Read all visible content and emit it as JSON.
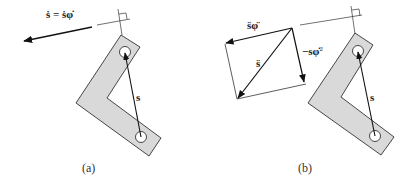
{
  "figure": {
    "panels": [
      {
        "id": "a",
        "caption": "(a)",
        "labels": {
          "velocity": "ṡ = ṡφ̇",
          "position": "s"
        }
      },
      {
        "id": "b",
        "caption": "(b)",
        "labels": {
          "tangential": "s̈φ̈",
          "centripetal": "−sφ̇",
          "centripetal_exp": "2",
          "acceleration": "s̈",
          "position": "s"
        }
      }
    ],
    "colors": {
      "link_fill": "#d9d9d9",
      "stroke": "#222222",
      "background": "#ffffff"
    }
  }
}
